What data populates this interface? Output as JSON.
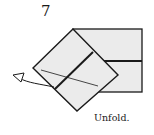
{
  "step": {
    "number": "7"
  },
  "caption": {
    "text": "Unfold."
  },
  "colors": {
    "paper_fill": "#ebebeb",
    "line": "#1a1a1a",
    "background": "#ffffff"
  },
  "icons": {
    "arrow": "unfold-arrow-icon"
  }
}
